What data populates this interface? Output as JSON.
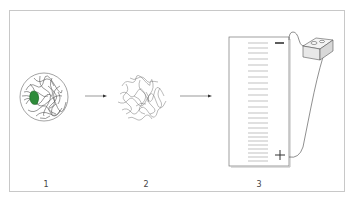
{
  "diagram": {
    "steps": [
      {
        "number": "1",
        "label": "1",
        "depiction": "folded protein with green highlighted region"
      },
      {
        "number": "2",
        "label": "2",
        "depiction": "denatured / unfolded protein chain"
      },
      {
        "number": "3",
        "label": "3",
        "depiction": "gel electrophoresis with bands and power supply"
      }
    ],
    "electrodes": {
      "negative": "−",
      "positive": "+"
    },
    "colors": {
      "highlight": "#2e8b3a",
      "line": "#444444",
      "frame": "#c8c8c8"
    }
  }
}
